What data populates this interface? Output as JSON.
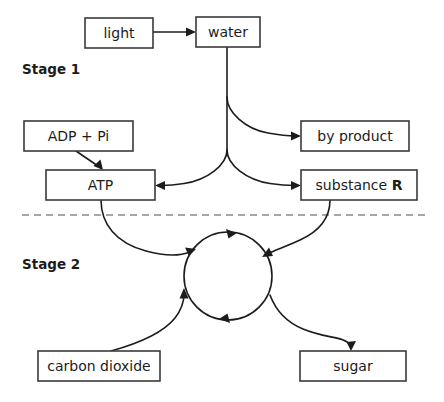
{
  "diagram": {
    "background_color": "#ffffff",
    "line_color": "#1c1c1c",
    "box_stroke_color": "#3a3a3a",
    "divider_color": "#8a8a8a",
    "stages": [
      {
        "id": "stage-1",
        "label": "Stage 1"
      },
      {
        "id": "stage-2",
        "label": "Stage 2"
      }
    ],
    "boxes": [
      {
        "id": "light",
        "label": "light",
        "x": 85,
        "y": 18,
        "w": 68,
        "h": 30
      },
      {
        "id": "water",
        "label": "water",
        "x": 196,
        "y": 17,
        "w": 64,
        "h": 30
      },
      {
        "id": "adp-pi",
        "label": "ADP + Pi",
        "x": 24,
        "y": 121,
        "w": 109,
        "h": 30
      },
      {
        "id": "by-product",
        "label": "by product",
        "x": 301,
        "y": 121,
        "w": 108,
        "h": 30
      },
      {
        "id": "atp",
        "label": "ATP",
        "x": 46,
        "y": 170,
        "w": 109,
        "h": 30
      },
      {
        "id": "substance-r",
        "label": "substance R",
        "label_plain": "substance",
        "label_bold": "R",
        "x": 301,
        "y": 170,
        "w": 116,
        "h": 30
      },
      {
        "id": "carbon-dioxide",
        "label": "carbon dioxide",
        "x": 38,
        "y": 351,
        "w": 122,
        "h": 30
      },
      {
        "id": "sugar",
        "label": "sugar",
        "x": 300,
        "y": 351,
        "w": 106,
        "h": 30
      }
    ],
    "cycle": {
      "id": "stage-2-cycle",
      "cx": 228,
      "cy": 276,
      "r": 44,
      "direction": "clockwise"
    },
    "divider": {
      "id": "stage-divider",
      "y": 215,
      "x1": 22,
      "x2": 428,
      "style": "dashed"
    },
    "connections": [
      {
        "from": "light",
        "to": "water",
        "type": "straight-arrow"
      },
      {
        "from": "water",
        "to": "by-product",
        "type": "curved-arrow"
      },
      {
        "from": "water",
        "to": "substance-r",
        "type": "curved-arrow"
      },
      {
        "from": "water",
        "to": "atp",
        "type": "curved-arrow"
      },
      {
        "from": "adp-pi",
        "to": "atp",
        "type": "straight-arrow"
      },
      {
        "from": "atp",
        "to": "stage-2-cycle",
        "type": "curved-arrow"
      },
      {
        "from": "substance-r",
        "to": "stage-2-cycle",
        "type": "curved-arrow"
      },
      {
        "from": "carbon-dioxide",
        "to": "stage-2-cycle",
        "type": "curved-arrow"
      },
      {
        "from": "stage-2-cycle",
        "to": "sugar",
        "type": "curved-arrow"
      }
    ]
  }
}
